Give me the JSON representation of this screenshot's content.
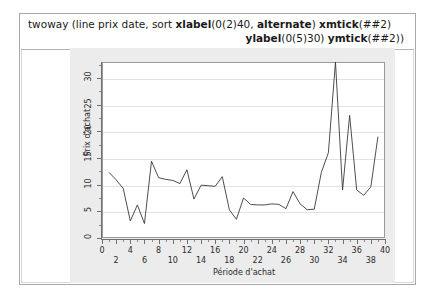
{
  "syntax": {
    "line1_parts": [
      {
        "t": "twoway (line prix date, sort ",
        "b": false
      },
      {
        "t": "xlabel",
        "b": true
      },
      {
        "t": "(0(2)40, ",
        "b": false
      },
      {
        "t": "alternate",
        "b": true
      },
      {
        "t": ") ",
        "b": false
      },
      {
        "t": "xmtick",
        "b": true
      },
      {
        "t": "(##2)",
        "b": false
      }
    ],
    "line2_parts": [
      {
        "t": "ylabel",
        "b": true
      },
      {
        "t": "(0(5)30) ",
        "b": false
      },
      {
        "t": "ymtick",
        "b": true
      },
      {
        "t": "(##2))",
        "b": false
      }
    ],
    "line1_text": "twoway (line prix date, sort xlabel(0(2)40, alternate) xmtick(##2)",
    "line2_text": "ylabel(0(5)30) ymtick(##2))"
  },
  "chart_data": {
    "type": "line",
    "title": "",
    "xlabel": "Période d'achat",
    "ylabel": "Prix d'achat",
    "xlim": [
      0,
      40
    ],
    "ylim": [
      0,
      33
    ],
    "xticks": [
      0,
      2,
      4,
      6,
      8,
      10,
      12,
      14,
      16,
      18,
      20,
      22,
      24,
      26,
      28,
      30,
      32,
      34,
      36,
      38,
      40
    ],
    "xticks_top_row": [
      0,
      4,
      8,
      12,
      16,
      20,
      24,
      28,
      32,
      36,
      40
    ],
    "xticks_bottom_row": [
      2,
      6,
      10,
      14,
      18,
      22,
      26,
      30,
      34,
      38
    ],
    "yticks": [
      0,
      5,
      10,
      15,
      20,
      25,
      30
    ],
    "minor_ticks_every": 1,
    "grid": true,
    "legend": "none",
    "line_color": "#3a3a3a",
    "series": [
      {
        "name": "prix",
        "x": [
          1,
          2,
          3,
          4,
          5,
          6,
          7,
          8,
          9,
          10,
          11,
          12,
          13,
          14,
          15,
          16,
          17,
          18,
          19,
          20,
          21,
          22,
          23,
          24,
          25,
          26,
          27,
          28,
          29,
          30,
          31,
          32,
          33,
          34,
          35,
          36,
          37,
          38,
          39
        ],
        "values": [
          12.3,
          10.9,
          9.3,
          3.2,
          6.2,
          2.7,
          14.4,
          11.3,
          11.0,
          10.8,
          10.2,
          12.8,
          7.3,
          9.9,
          9.8,
          9.7,
          11.5,
          5.3,
          3.5,
          7.5,
          6.3,
          6.2,
          6.2,
          6.4,
          6.3,
          5.5,
          8.7,
          6.4,
          5.3,
          5.4,
          12.3,
          16.0,
          33.0,
          9.0,
          23.0,
          9.0,
          8.0,
          9.6,
          19.0
        ]
      }
    ]
  }
}
